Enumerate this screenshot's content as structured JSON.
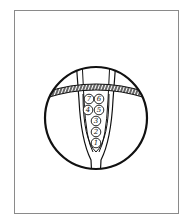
{
  "diagram": {
    "colors": {
      "stroke": "#111111",
      "frame": "#8a8a8a",
      "background": "#ffffff"
    },
    "eggs": [
      {
        "label": "7",
        "x": 89,
        "y": 99
      },
      {
        "label": "6",
        "x": 99,
        "y": 99
      },
      {
        "label": "4",
        "x": 88,
        "y": 110
      },
      {
        "label": "5",
        "x": 99,
        "y": 110
      },
      {
        "label": "3",
        "x": 96,
        "y": 121
      },
      {
        "label": "2",
        "x": 96,
        "y": 132
      },
      {
        "label": "1",
        "x": 96,
        "y": 143
      }
    ]
  }
}
